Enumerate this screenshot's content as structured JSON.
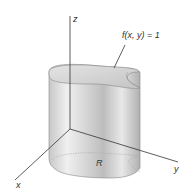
{
  "figure": {
    "axes": {
      "x_label": "x",
      "y_label": "y",
      "z_label": "z"
    },
    "surface_label": "f(x, y) = 1",
    "region_label": "R",
    "colors": {
      "background": "#ffffff",
      "line": "#333333",
      "surface_light": "#f2f2f2",
      "surface_mid": "#cfcfcf",
      "surface_dark": "#a8a8a8",
      "top_face": "#d6d6d6"
    }
  }
}
